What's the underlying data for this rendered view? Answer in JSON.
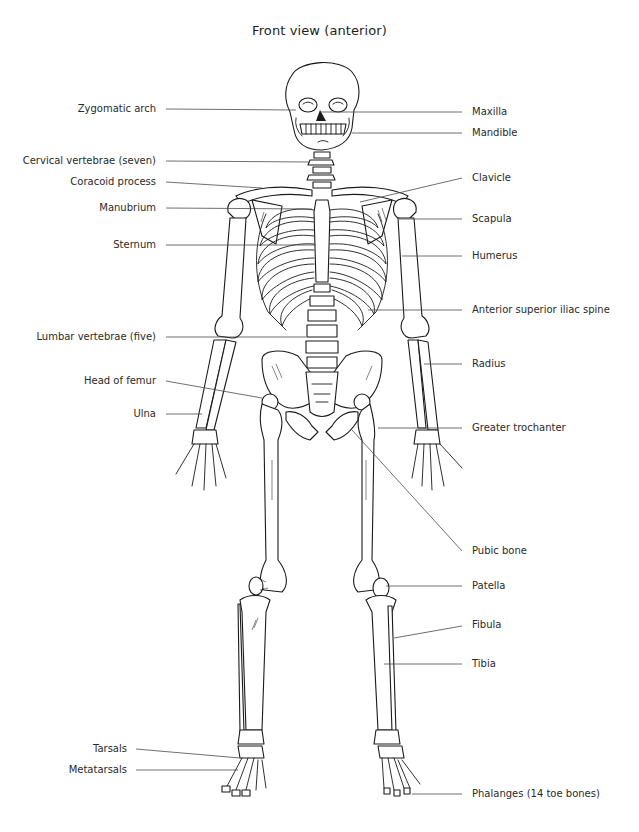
{
  "diagram": {
    "title": "Front view (anterior)",
    "colors": {
      "line": "#1a1a1a",
      "leader": "#4a4a4a",
      "text": "#2a2a2a",
      "background": "#ffffff"
    },
    "labels_left": [
      {
        "id": "zygomatic-arch",
        "text": "Zygomatic arch",
        "y": 109
      },
      {
        "id": "cervical-vertebrae",
        "text": "Cervical vertebrae (seven)",
        "y": 161
      },
      {
        "id": "coracoid-process",
        "text": "Coracoid process",
        "y": 182
      },
      {
        "id": "manubrium",
        "text": "Manubrium",
        "y": 208
      },
      {
        "id": "sternum",
        "text": "Sternum",
        "y": 245
      },
      {
        "id": "lumbar-vertebrae",
        "text": "Lumbar vertebrae (five)",
        "y": 337
      },
      {
        "id": "head-of-femur",
        "text": "Head of femur",
        "y": 381
      },
      {
        "id": "ulna",
        "text": "Ulna",
        "y": 414
      },
      {
        "id": "tarsals",
        "text": "Tarsals",
        "y": 749
      },
      {
        "id": "metatarsals",
        "text": "Metatarsals",
        "y": 770
      }
    ],
    "labels_right": [
      {
        "id": "maxilla",
        "text": "Maxilla",
        "y": 112
      },
      {
        "id": "mandible",
        "text": "Mandible",
        "y": 133
      },
      {
        "id": "clavicle",
        "text": "Clavicle",
        "y": 178
      },
      {
        "id": "scapula",
        "text": "Scapula",
        "y": 219
      },
      {
        "id": "humerus",
        "text": "Humerus",
        "y": 256
      },
      {
        "id": "anterior-superior-iliac-spine",
        "text": "Anterior superior iliac spine",
        "y": 310
      },
      {
        "id": "radius",
        "text": "Radius",
        "y": 364
      },
      {
        "id": "greater-trochanter",
        "text": "Greater trochanter",
        "y": 428
      },
      {
        "id": "pubic-bone",
        "text": "Pubic bone",
        "y": 551
      },
      {
        "id": "patella",
        "text": "Patella",
        "y": 586
      },
      {
        "id": "fibula",
        "text": "Fibula",
        "y": 625
      },
      {
        "id": "tibia",
        "text": "Tibia",
        "y": 664
      },
      {
        "id": "phalanges",
        "text": "Phalanges (14 toe bones)",
        "y": 794
      }
    ]
  }
}
